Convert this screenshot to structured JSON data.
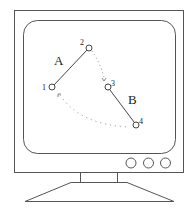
{
  "diagram": {
    "colors": {
      "stroke": "#444444",
      "background": "#ffffff",
      "dots": "#888888"
    },
    "segments": [
      {
        "label": "A",
        "from": "1",
        "to": "2"
      },
      {
        "label": "B",
        "from": "3",
        "to": "4"
      }
    ],
    "points": [
      {
        "label": "1"
      },
      {
        "label": "2"
      },
      {
        "label": "3"
      },
      {
        "label": "4"
      }
    ],
    "dotted_links": [
      {
        "from": "2",
        "to": "3"
      },
      {
        "from": "1",
        "to": "4"
      }
    ],
    "monitor_buttons": 3
  }
}
